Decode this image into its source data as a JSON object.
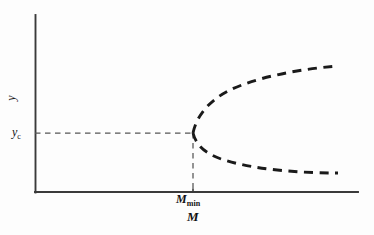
{
  "figure": {
    "type": "bifurcation-diagram",
    "background_color": "#fdfdfd",
    "line_color": "#1a1a1a",
    "axis_color": "#3a3a3a",
    "guide_color": "#555555"
  },
  "labels": {
    "y_axis": "y",
    "y_critical_base": "y",
    "y_critical_sub": "c",
    "m_min_base": "M",
    "m_min_sub": "min",
    "x_axis": "M"
  },
  "chart_data": {
    "type": "line",
    "title": "",
    "xlabel": "M",
    "ylabel": "y",
    "grid": false,
    "legend": null,
    "axis_origin_px": [
      35,
      192
    ],
    "x_axis_end_px": [
      358,
      192
    ],
    "y_axis_top_px": [
      35,
      15
    ],
    "annotations": [
      {
        "name": "critical-value-tick",
        "label": "y_c",
        "axis": "y",
        "y_px": 133
      },
      {
        "name": "minimum-mass-tick",
        "label": "M_min",
        "axis": "x",
        "x_px": 193
      },
      {
        "name": "bifurcation-point",
        "x_px": 193,
        "y_px": 133
      }
    ],
    "series": [
      {
        "name": "stable-single-solution",
        "style": "dashed",
        "description": "Horizontal guide at y = y_c for M < M_min",
        "path_px": "M 35 133 L 193 133"
      },
      {
        "name": "critical-mass-guide",
        "style": "dashed",
        "description": "Vertical guide at M = M_min",
        "path_px": "M 193 133 L 193 192"
      },
      {
        "name": "upper-branch",
        "style": "dashed",
        "description": "Upper solution branch rising from the bifurcation point",
        "path_px": "M 193 133 C 196 118, 207 102, 228 91 C 256 77, 300 69, 338 66"
      },
      {
        "name": "lower-branch",
        "style": "dashed",
        "description": "Lower solution branch falling from the bifurcation point",
        "path_px": "M 193 133 C 196 145, 205 154, 224 160 C 256 170, 302 173, 338 173"
      }
    ]
  }
}
